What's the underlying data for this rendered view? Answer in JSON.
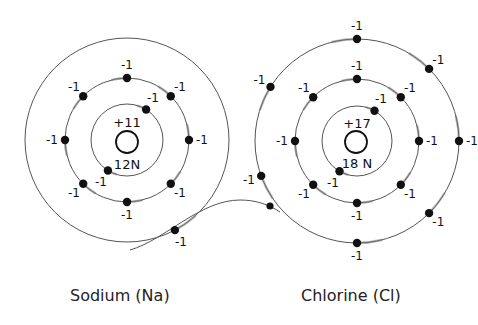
{
  "diagram": {
    "atoms": [
      {
        "name": "Sodium (Na)",
        "nucleus_charge": "+11",
        "neutrons": "12N",
        "center": [
          127,
          140
        ],
        "shell_radii": [
          36,
          62,
          102
        ],
        "shells": [
          {
            "electrons": 2,
            "electron_label": "-1"
          },
          {
            "electrons": 8,
            "electron_label": "-1"
          },
          {
            "electrons": 1,
            "electron_label": "-1"
          }
        ]
      },
      {
        "name": "Chlorine (Cl)",
        "nucleus_charge": "+17",
        "neutrons": "18 N",
        "center": [
          357,
          141
        ],
        "shell_radii": [
          35,
          62,
          102
        ],
        "shells": [
          {
            "electrons": 2,
            "electron_label": "-1"
          },
          {
            "electrons": 8,
            "electron_label": "-1"
          },
          {
            "electrons": 7,
            "electron_label": "-1"
          }
        ]
      }
    ],
    "transfer": {
      "from": "Sodium (Na)",
      "to": "Chlorine (Cl)",
      "description": "outer electron moves along curved path from Na outer shell to Cl outer shell"
    },
    "electron_charge_label": "-1"
  },
  "labels": {
    "sodium": "Sodium (Na)",
    "chlorine": "Chlorine (Cl)"
  }
}
